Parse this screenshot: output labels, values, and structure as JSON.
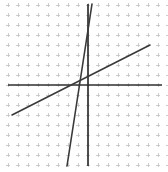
{
  "canvas": {
    "width": 168,
    "height": 172,
    "background": "#ffffff"
  },
  "colors": {
    "grid": "#c2c2c2",
    "axis": "#2f2f2f",
    "line": "#3a3a3a",
    "background": "#ffffff"
  },
  "chart_data": {
    "type": "line",
    "title": "",
    "subtitle": "",
    "xlabel": "",
    "ylabel": "",
    "grid": true,
    "grid_style": "cross-ticks",
    "grid_spacing_px": 10,
    "grid_columns": 17,
    "grid_rows": 17,
    "legend": "none",
    "axis_style": "centered-cross",
    "origin_px": {
      "x": 88,
      "y": 85
    },
    "units_per_grid": 1,
    "xlim": [
      -8,
      8
    ],
    "ylim": [
      -8.5,
      8.5
    ],
    "xticks": [
      -8,
      -7,
      -6,
      -5,
      -4,
      -3,
      -2,
      -1,
      0,
      1,
      2,
      3,
      4,
      5,
      6,
      7,
      8
    ],
    "yticks": [
      -8,
      -7,
      -6,
      -5,
      -4,
      -3,
      -2,
      -1,
      0,
      1,
      2,
      3,
      4,
      5,
      6,
      7,
      8
    ],
    "xtick_labels": [],
    "ytick_labels": [],
    "annotations": [],
    "axes": [
      {
        "name": "x-axis",
        "orientation": "horizontal",
        "y_value": 0,
        "px": {
          "x1": 8,
          "y1": 85,
          "x2": 162,
          "y2": 85
        }
      },
      {
        "name": "y-axis",
        "orientation": "vertical",
        "x_value": 0,
        "px": {
          "x1": 88,
          "y1": 4,
          "x2": 88,
          "y2": 166
        }
      }
    ],
    "series": [
      {
        "name": "shallow-line",
        "equation": "y = 0.51x + 0.4",
        "slope": 0.51,
        "intercept": 0.4,
        "x_intercept": -0.79,
        "points": [
          [
            -7.6,
            -3.0
          ],
          [
            6.2,
            4.0
          ]
        ],
        "px": {
          "x1": 12,
          "y1": 115,
          "x2": 150,
          "y2": 45
        },
        "color": "#3a3a3a",
        "width_px": 1.6
      },
      {
        "name": "steep-line",
        "equation": "y = -6.5x + 2.6",
        "slope": -6.5,
        "intercept": 2.6,
        "x_intercept": 0.4,
        "points": [
          [
            0.4,
            8.1
          ],
          [
            -2.1,
            -8.1
          ]
        ],
        "px": {
          "x1": 92,
          "y1": 4,
          "x2": 67,
          "y2": 166
        },
        "color": "#3a3a3a",
        "width_px": 1.6
      }
    ],
    "intersection": {
      "label": "solution",
      "x": -0.31,
      "y": 0.24,
      "px": {
        "x": 85,
        "y": 83
      }
    }
  }
}
